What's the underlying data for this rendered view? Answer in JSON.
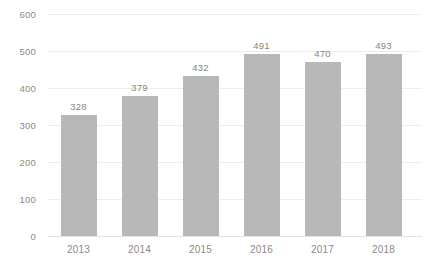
{
  "chart_data": {
    "type": "bar",
    "title": "",
    "subtitle": "",
    "xlabel": "",
    "ylabel": "",
    "categories": [
      "2013",
      "2014",
      "2015",
      "2016",
      "2017",
      "2018"
    ],
    "values": [
      328,
      379,
      432,
      491,
      470,
      493
    ],
    "series": [
      {
        "name": "",
        "values": [
          328,
          379,
          432,
          491,
          470,
          493
        ]
      }
    ],
    "data_labels": [
      "328",
      "379",
      "432",
      "491",
      "470",
      "493"
    ],
    "ylim": [
      0,
      600
    ],
    "yticks": [
      0,
      100,
      200,
      300,
      400,
      500,
      600
    ],
    "ytick_labels": [
      "0",
      "100",
      "200",
      "300",
      "400",
      "500",
      "600"
    ],
    "xtick_labels": [
      "2013",
      "2014",
      "2015",
      "2016",
      "2017",
      "2018"
    ],
    "grid": true,
    "grid_axis": "y",
    "legend": false,
    "legend_position": "none",
    "colors": {
      "bar": "#b8b8b8",
      "gridline": "#ededed",
      "baseline": "#e4e4e4",
      "tick_label": "#8a8a8a",
      "data_label": "#858585",
      "background": "#ffffff"
    }
  }
}
